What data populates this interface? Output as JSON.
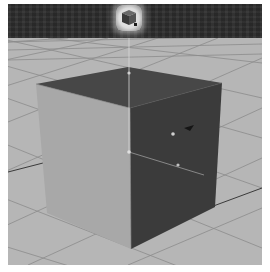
{
  "viewport": {
    "label": "3D perspective viewport",
    "background_color": "#b4b4b4",
    "grid_line_color": "#8a8a8a"
  },
  "shelf": {
    "background_color": "#2c2c2c",
    "active_tool": {
      "icon": "polygon-cube-icon",
      "state": "highlighted"
    }
  },
  "object": {
    "type": "polygon-cube",
    "faces": {
      "top_color": "#4a4a4a",
      "left_color": "#a6a6a6",
      "right_color": "#3c3c3c"
    },
    "selected": true
  },
  "manipulator": {
    "type": "move-tool",
    "axes": [
      "y-axis",
      "x-axis",
      "z-axis"
    ]
  }
}
